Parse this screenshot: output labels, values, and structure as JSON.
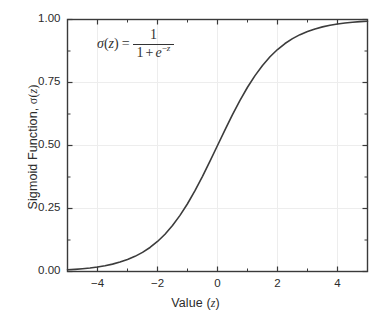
{
  "chart_data": {
    "type": "line",
    "title": "",
    "xlabel": "Value (z)",
    "ylabel": "Sigmoid Function, σ(z)",
    "xlim": [
      -5,
      5
    ],
    "ylim": [
      0.0,
      1.0
    ],
    "grid": true,
    "legend": null,
    "annotation": "σ(z) = 1 / (1 + e^(-z))",
    "x_major_ticks": [
      -4,
      -2,
      0,
      2,
      4
    ],
    "x_major_tick_labels": [
      "−4",
      "−2",
      "0",
      "2",
      "4"
    ],
    "x_minor_ticks": [
      -5,
      -3,
      -1,
      1,
      3,
      5
    ],
    "y_major_ticks": [
      0.0,
      0.25,
      0.5,
      0.75,
      1.0
    ],
    "y_major_tick_labels": [
      "0.00",
      "0.25",
      "0.50",
      "0.75",
      "1.00"
    ],
    "y_minor_ticks": [
      0.125,
      0.375,
      0.625,
      0.875
    ],
    "series": [
      {
        "name": "sigmoid",
        "color": "#3c3c3c",
        "linewidth": 1.6,
        "x": [
          -5.0,
          -4.75,
          -4.5,
          -4.25,
          -4.0,
          -3.75,
          -3.5,
          -3.25,
          -3.0,
          -2.75,
          -2.5,
          -2.25,
          -2.0,
          -1.75,
          -1.5,
          -1.25,
          -1.0,
          -0.75,
          -0.5,
          -0.25,
          0.0,
          0.25,
          0.5,
          0.75,
          1.0,
          1.25,
          1.5,
          1.75,
          2.0,
          2.25,
          2.5,
          2.75,
          3.0,
          3.25,
          3.5,
          3.75,
          4.0,
          4.25,
          4.5,
          4.75,
          5.0
        ],
        "y": [
          0.0067,
          0.0086,
          0.011,
          0.014,
          0.018,
          0.023,
          0.0293,
          0.0373,
          0.0474,
          0.0601,
          0.0759,
          0.0953,
          0.1192,
          0.148,
          0.1824,
          0.2227,
          0.2689,
          0.3208,
          0.3775,
          0.4378,
          0.5,
          0.5622,
          0.6225,
          0.6792,
          0.7311,
          0.7773,
          0.8176,
          0.852,
          0.8808,
          0.9047,
          0.9241,
          0.9399,
          0.9526,
          0.9627,
          0.9707,
          0.977,
          0.982,
          0.986,
          0.989,
          0.9914,
          0.9933
        ]
      }
    ]
  },
  "chart": {
    "x_axis_title_prefix": "Value (",
    "x_axis_title_var": "z",
    "x_axis_title_suffix": ")",
    "y_axis_title_prefix": "Sigmoid Function, ",
    "y_axis_title_sigma": "σ",
    "y_axis_title_open": "(",
    "y_axis_title_var": "z",
    "y_axis_title_close": ")"
  },
  "formula": {
    "sigma": "σ",
    "open_paren": "(",
    "arg": "z",
    "close_paren": ")",
    "equals": "=",
    "numerator": "1",
    "denominator_one": "1",
    "denominator_plus": "+",
    "denominator_e": "e",
    "exponent_minus": "−",
    "exponent_var": "z"
  },
  "style": {
    "background": "#ffffff",
    "axis_color": "#3a3a3a",
    "grid_color": "#ededed",
    "curve_color": "#3c3c3c",
    "text_color": "#2b2b2b"
  }
}
